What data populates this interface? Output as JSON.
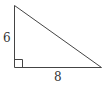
{
  "diagram": {
    "type": "right-triangle",
    "legs": {
      "vertical": {
        "label": "6"
      },
      "horizontal": {
        "label": "8"
      }
    },
    "right_angle_marker": true,
    "colors": {
      "stroke": "#444444",
      "label": "#333333",
      "background": "#ffffff"
    }
  }
}
